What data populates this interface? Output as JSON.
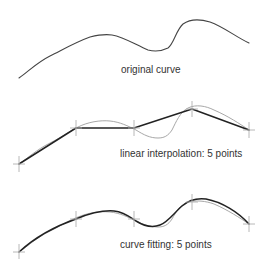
{
  "panels": [
    {
      "id": "original",
      "label": "original curve",
      "label_pos": [
        121,
        73
      ]
    },
    {
      "id": "linear",
      "label": "linear interpolation: 5 points",
      "label_pos": [
        120,
        157
      ],
      "points": [
        [
          19,
          164
        ],
        [
          76,
          128
        ],
        [
          134,
          128
        ],
        [
          192,
          109
        ],
        [
          249,
          130
        ]
      ]
    },
    {
      "id": "fitting",
      "label": "curve fitting: 5 points",
      "label_pos": [
        120,
        248
      ],
      "points": [
        [
          19,
          252
        ],
        [
          76,
          219
        ],
        [
          134,
          219
        ],
        [
          192,
          202
        ],
        [
          249,
          224
        ]
      ]
    }
  ],
  "colors": {
    "original_curve": "#444444",
    "ghost_curve": "#a8a8a8",
    "approximation": "#222222",
    "control_marker": "#b0b0b0"
  },
  "control_points_count": 5
}
